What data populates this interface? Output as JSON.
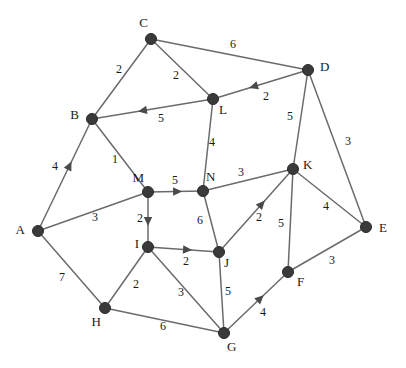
{
  "figure": {
    "kind": "weighted-graph-diagram",
    "width": 406,
    "height": 368,
    "background_color": "#ffffff",
    "node_color": "#3a3a3a",
    "edge_color": "#6b6b6b",
    "arrow_color": "#4a4a4a",
    "label_color": "#1a1a1a"
  },
  "nodes": [
    {
      "id": "A",
      "label": "A",
      "x": 38,
      "y": 231,
      "label_dx": -13,
      "label_dy": 0
    },
    {
      "id": "B",
      "label": "B",
      "x": 92,
      "y": 119,
      "label_dx": -13,
      "label_dy": -3
    },
    {
      "id": "C",
      "label": "C",
      "x": 151,
      "y": 39,
      "label_dx": -3,
      "label_dy": -15
    },
    {
      "id": "D",
      "label": "D",
      "x": 308,
      "y": 70,
      "label_dx": 12,
      "label_dy": -2
    },
    {
      "id": "E",
      "label": "E",
      "x": 366,
      "y": 227,
      "label_dx": 13,
      "label_dy": 2
    },
    {
      "id": "F",
      "label": "F",
      "x": 288,
      "y": 272,
      "label_dx": 9,
      "label_dy": 11
    },
    {
      "id": "G",
      "label": "G",
      "x": 224,
      "y": 333,
      "label_dx": 3,
      "label_dy": 15
    },
    {
      "id": "H",
      "label": "H",
      "x": 105,
      "y": 308,
      "label_dx": -4,
      "label_dy": 15
    },
    {
      "id": "I",
      "label": "I",
      "x": 148,
      "y": 247,
      "label_dx": -9,
      "label_dy": -2
    },
    {
      "id": "J",
      "label": "J",
      "x": 219,
      "y": 252,
      "label_dx": 5,
      "label_dy": 12
    },
    {
      "id": "K",
      "label": "K",
      "x": 293,
      "y": 169,
      "label_dx": 10,
      "label_dy": -3
    },
    {
      "id": "L",
      "label": "L",
      "x": 213,
      "y": 99,
      "label_dx": 6,
      "label_dy": 12
    },
    {
      "id": "M",
      "label": "M",
      "x": 148,
      "y": 192,
      "label_dx": -4,
      "label_dy": -13
    },
    {
      "id": "N",
      "label": "N",
      "x": 203,
      "y": 191,
      "label_dx": 3,
      "label_dy": -13
    }
  ],
  "edges": [
    {
      "from": "B",
      "to": "C",
      "weight": "2",
      "directed": false,
      "label_x": 119,
      "label_y": 70
    },
    {
      "from": "C",
      "to": "D",
      "weight": "6",
      "directed": false,
      "label_x": 233,
      "label_y": 45
    },
    {
      "from": "C",
      "to": "L",
      "weight": "2",
      "directed": false,
      "label_x": 176,
      "label_y": 76
    },
    {
      "from": "L",
      "to": "B",
      "weight": "5",
      "directed": true,
      "label_x": 161,
      "label_y": 119
    },
    {
      "from": "D",
      "to": "L",
      "weight": "2",
      "directed": true,
      "label_x": 266,
      "label_y": 97
    },
    {
      "from": "D",
      "to": "K",
      "weight": "5",
      "directed": false,
      "label_x": 290,
      "label_y": 117
    },
    {
      "from": "D",
      "to": "E",
      "weight": "3",
      "directed": false,
      "label_x": 348,
      "label_y": 142
    },
    {
      "from": "L",
      "to": "N",
      "weight": "4",
      "directed": false,
      "label_x": 212,
      "label_y": 143
    },
    {
      "from": "A",
      "to": "B",
      "weight": "4",
      "directed": true,
      "label_x": 55,
      "label_y": 167
    },
    {
      "from": "B",
      "to": "M",
      "weight": "1",
      "directed": false,
      "label_x": 115,
      "label_y": 160
    },
    {
      "from": "A",
      "to": "M",
      "weight": "3",
      "directed": false,
      "label_x": 95,
      "label_y": 218
    },
    {
      "from": "M",
      "to": "N",
      "weight": "5",
      "directed": true,
      "label_x": 175,
      "label_y": 181
    },
    {
      "from": "N",
      "to": "K",
      "weight": "3",
      "directed": false,
      "label_x": 241,
      "label_y": 173
    },
    {
      "from": "M",
      "to": "I",
      "weight": "2",
      "directed": true,
      "label_x": 140,
      "label_y": 219
    },
    {
      "from": "N",
      "to": "J",
      "weight": "6",
      "directed": false,
      "label_x": 200,
      "label_y": 221
    },
    {
      "from": "I",
      "to": "J",
      "weight": "2",
      "directed": true,
      "label_x": 186,
      "label_y": 262
    },
    {
      "from": "J",
      "to": "K",
      "weight": "2",
      "directed": true,
      "label_x": 259,
      "label_y": 218
    },
    {
      "from": "K",
      "to": "E",
      "weight": "4",
      "directed": false,
      "label_x": 326,
      "label_y": 207
    },
    {
      "from": "K",
      "to": "F",
      "weight": "5",
      "directed": false,
      "label_x": 281,
      "label_y": 224
    },
    {
      "from": "E",
      "to": "F",
      "weight": "3",
      "directed": false,
      "label_x": 332,
      "label_y": 261
    },
    {
      "from": "A",
      "to": "H",
      "weight": "7",
      "directed": false,
      "label_x": 62,
      "label_y": 278
    },
    {
      "from": "I",
      "to": "H",
      "weight": "2",
      "directed": false,
      "label_x": 136,
      "label_y": 285
    },
    {
      "from": "I",
      "to": "G",
      "weight": "3",
      "directed": false,
      "label_x": 181,
      "label_y": 293
    },
    {
      "from": "J",
      "to": "G",
      "weight": "5",
      "directed": false,
      "label_x": 228,
      "label_y": 292
    },
    {
      "from": "H",
      "to": "G",
      "weight": "6",
      "directed": false,
      "label_x": 163,
      "label_y": 327
    },
    {
      "from": "G",
      "to": "F",
      "weight": "4",
      "directed": true,
      "label_x": 263,
      "label_y": 313
    }
  ]
}
